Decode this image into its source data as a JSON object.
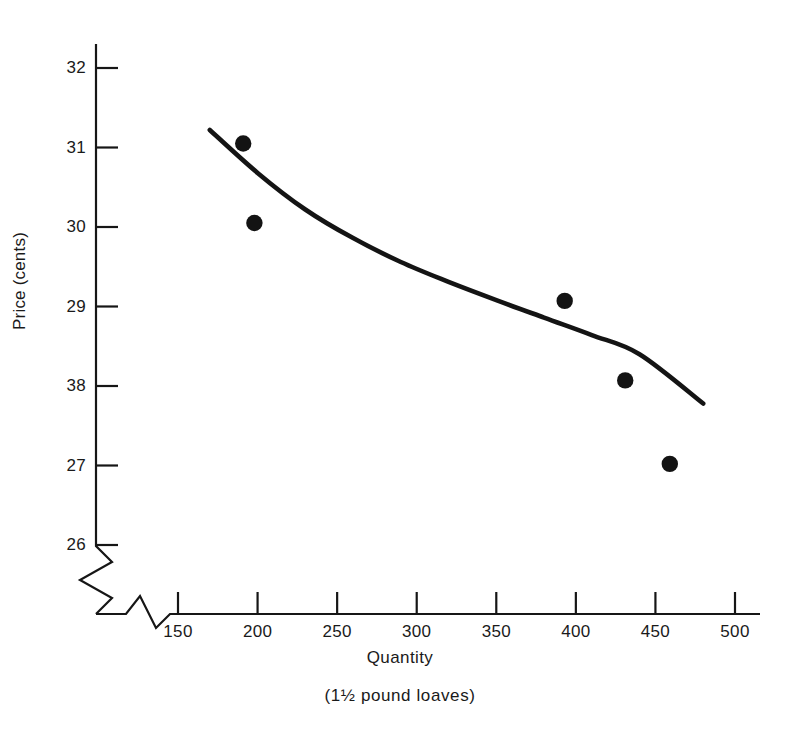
{
  "chart_data": {
    "type": "scatter",
    "title": "",
    "subtitle": "",
    "xlabel": "Quantity",
    "xlabel_sub": "(1½ pound loaves)",
    "ylabel": "Price (cents)",
    "xlim": [
      130,
      510
    ],
    "ylim": [
      25.6,
      32.4
    ],
    "grid": false,
    "legend": null,
    "axis_break_x": true,
    "axis_break_y": true,
    "x_ticks": [
      {
        "value": 150,
        "label": "150"
      },
      {
        "value": 200,
        "label": "200"
      },
      {
        "value": 250,
        "label": "250"
      },
      {
        "value": 300,
        "label": "300"
      },
      {
        "value": 350,
        "label": "350"
      },
      {
        "value": 400,
        "label": "400"
      },
      {
        "value": 450,
        "label": "450"
      },
      {
        "value": 500,
        "label": "500"
      }
    ],
    "y_ticks": [
      {
        "value": 32,
        "label": "32"
      },
      {
        "value": 31,
        "label": "31"
      },
      {
        "value": 30,
        "label": "30"
      },
      {
        "value": 29,
        "label": "29"
      },
      {
        "value": 28,
        "label": "38"
      },
      {
        "value": 27,
        "label": "27"
      },
      {
        "value": 26,
        "label": "26"
      }
    ],
    "series": [
      {
        "name": "Observed price-quantity pairs",
        "type": "scatter",
        "marker": "filled-circle",
        "color": "#131313",
        "points": [
          {
            "x": 191,
            "y": 31.05
          },
          {
            "x": 198,
            "y": 30.05
          },
          {
            "x": 393,
            "y": 29.07
          },
          {
            "x": 431,
            "y": 28.07
          },
          {
            "x": 459,
            "y": 27.02
          }
        ]
      },
      {
        "name": "Fitted demand curve",
        "type": "line",
        "color": "#141414",
        "points": [
          {
            "x": 170,
            "y": 31.22
          },
          {
            "x": 200,
            "y": 30.68
          },
          {
            "x": 230,
            "y": 30.22
          },
          {
            "x": 260,
            "y": 29.86
          },
          {
            "x": 290,
            "y": 29.56
          },
          {
            "x": 320,
            "y": 29.31
          },
          {
            "x": 350,
            "y": 29.08
          },
          {
            "x": 380,
            "y": 28.86
          },
          {
            "x": 410,
            "y": 28.64
          },
          {
            "x": 440,
            "y": 28.4
          },
          {
            "x": 480,
            "y": 27.78
          }
        ]
      }
    ]
  },
  "colors": {
    "ink": "#161616",
    "marker": "#131313",
    "curve": "#141414",
    "background": "#ffffff"
  }
}
